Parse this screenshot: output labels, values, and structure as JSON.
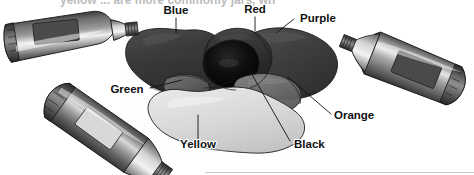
{
  "figure": {
    "media": "grayscale halftone scan",
    "background_color": "#ffffff",
    "cropped_caption_fragment": "yellow      ...  are more  commonly  jars,  wh"
  },
  "labels": [
    {
      "id": "blue",
      "text": "Blue",
      "x": 176,
      "y": 14,
      "anchor": "middle"
    },
    {
      "id": "red",
      "text": "Red",
      "x": 255,
      "y": 13,
      "anchor": "middle"
    },
    {
      "id": "purple",
      "text": "Purple",
      "x": 316,
      "y": 22,
      "anchor": "middle"
    },
    {
      "id": "green",
      "text": "Green",
      "x": 129,
      "y": 92,
      "anchor": "middle"
    },
    {
      "id": "orange",
      "text": "Orange",
      "x": 333,
      "y": 118,
      "anchor": "start"
    },
    {
      "id": "yellow",
      "text": "Yellow",
      "x": 198,
      "y": 146,
      "anchor": "middle"
    },
    {
      "id": "black",
      "text": "Black",
      "x": 293,
      "y": 146,
      "anchor": "start"
    }
  ],
  "leader_lines": [
    {
      "id": "leader-blue",
      "from_label": "blue",
      "path": "M 176 18 L 176 32"
    },
    {
      "id": "leader-red",
      "from_label": "red",
      "path": "M 255 17 L 255 30"
    },
    {
      "id": "leader-purple",
      "from_label": "purple",
      "path": "M 293 20 L 278 31"
    },
    {
      "id": "leader-green",
      "from_label": "green",
      "path": "M 147 88 L 178 81"
    },
    {
      "id": "leader-orange",
      "from_label": "orange",
      "path": "M 332 115 L 290 78"
    },
    {
      "id": "leader-yellow",
      "from_label": "yellow",
      "path": "M 198 141 L 198 118"
    },
    {
      "id": "leader-black",
      "from_label": "black",
      "path": "M 291 142 L 253 73"
    }
  ],
  "paint_blobs": [
    {
      "id": "blob-blue",
      "label": "Blue",
      "tone_hex": "#3c3c3c",
      "shade_hex": "#2c2c2c",
      "highlight_hex": "#575757"
    },
    {
      "id": "blob-purple",
      "label": "Purple",
      "tone_hex": "#414141",
      "shade_hex": "#303030",
      "highlight_hex": "#5c5c5c"
    },
    {
      "id": "blob-red",
      "label": "Red",
      "tone_hex": "#333333",
      "shade_hex": "#242424",
      "highlight_hex": "#4b4b4b"
    },
    {
      "id": "blob-black",
      "label": "Black",
      "tone_hex": "#0d0d0d",
      "shade_hex": "#000000",
      "highlight_hex": "#2a2a2a"
    },
    {
      "id": "blob-yellow",
      "label": "Yellow",
      "tone_hex": "#d9d9d9",
      "shade_hex": "#c2c2c2",
      "highlight_hex": "#ededed"
    },
    {
      "id": "blob-orange",
      "label": "Orange",
      "tone_hex": "#6e6e6e",
      "shade_hex": "#5a5a5a",
      "highlight_hex": "#8a8a8a"
    },
    {
      "id": "blob-green",
      "label": "Green",
      "tone_hex": "#5a5a5a",
      "shade_hex": "#474747",
      "highlight_hex": "#7d7d7d"
    }
  ],
  "paint_tubes": [
    {
      "id": "tube-left",
      "position": "upper-left",
      "rotation_deg": -8,
      "body_hex": "#8d8d8d",
      "label_patch_hex": "#4a4a4a",
      "nozzle_hex": "#bdbdbd"
    },
    {
      "id": "tube-right",
      "position": "upper-right",
      "rotation_deg": 24,
      "body_hex": "#8d8d8d",
      "label_patch_hex": "#4a4a4a",
      "nozzle_hex": "#c2c2c2"
    },
    {
      "id": "tube-bottom",
      "position": "lower-left",
      "rotation_deg": 38,
      "body_hex": "#7f7f7f",
      "label_patch_hex": "#d7d7d7",
      "nozzle_hex": "#c8c8c8"
    }
  ],
  "colors": {
    "outline": "#1c1c1c",
    "text": "#111111",
    "page": "#ffffff",
    "rule": "#c9c9c9"
  }
}
